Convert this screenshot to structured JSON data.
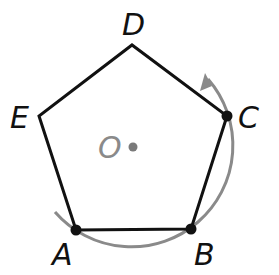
{
  "figure": {
    "vertices": {
      "A": {
        "label": "A",
        "x": 76,
        "y": 230
      },
      "B": {
        "label": "B",
        "x": 191,
        "y": 229
      },
      "C": {
        "label": "C",
        "x": 227,
        "y": 116
      },
      "D": {
        "label": "D",
        "x": 132,
        "y": 45
      },
      "E": {
        "label": "E",
        "x": 39,
        "y": 116
      }
    },
    "center": {
      "label": "O",
      "x": 133,
      "y": 147
    },
    "marked_points": [
      "A",
      "B",
      "C"
    ],
    "rotation_arc": {
      "direction": "counterclockwise",
      "from": "A",
      "through": "B",
      "to": "C"
    },
    "colors": {
      "polygon": "#111111",
      "arc": "#808080",
      "center": "#7a7a7a",
      "labels": "#111111",
      "center_label": "#8a8a8a"
    }
  }
}
